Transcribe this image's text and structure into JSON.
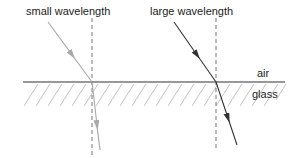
{
  "labels": {
    "small": "small wavelength",
    "large": "large wavelength",
    "air": "air",
    "glass": "glass"
  },
  "colors": {
    "interface": "#333333",
    "hatch": "#bbbbbb",
    "normal": "#666666",
    "small_ray": "#a8a8a8",
    "large_ray": "#333333"
  },
  "geometry": {
    "interface_y": 82,
    "interface_x": [
      23,
      285
    ],
    "small_ray": {
      "start": [
        48,
        22
      ],
      "hit": [
        92,
        82
      ],
      "end": [
        100,
        150
      ],
      "normal_x": 92
    },
    "large_ray": {
      "start": [
        174,
        22
      ],
      "hit": [
        216,
        82
      ],
      "end": [
        237,
        145
      ],
      "normal_x": 216
    }
  }
}
